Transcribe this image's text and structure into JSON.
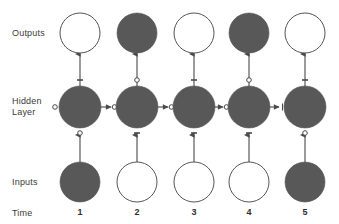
{
  "figure": {
    "type": "diagram",
    "subtype": "unfolded-recurrent-neural-network",
    "width": 339,
    "height": 224,
    "background_color": "#ffffff"
  },
  "colors": {
    "node_filled": "#585858",
    "node_empty_fill": "#ffffff",
    "node_stroke": "#555555",
    "edge": "#4a4a4a",
    "text": "#3a3a3a"
  },
  "row_labels": {
    "outputs": "Outputs",
    "hidden_line1": "Hidden",
    "hidden_line2": "Layer",
    "inputs": "Inputs",
    "time": "Time"
  },
  "geometry": {
    "column_centers": [
      80,
      137,
      194,
      249,
      305
    ],
    "row_y": {
      "outputs": 33,
      "hidden": 107,
      "inputs": 182,
      "time_labels": 213
    },
    "node_radius": {
      "outputs": 20,
      "hidden": 21,
      "inputs": 20
    }
  },
  "time_steps": [
    {
      "label": "1",
      "x": 80,
      "input_filled": true,
      "hidden_filled": true,
      "output_filled": false
    },
    {
      "label": "2",
      "x": 137,
      "input_filled": false,
      "hidden_filled": true,
      "output_filled": true
    },
    {
      "label": "3",
      "x": 194,
      "input_filled": false,
      "hidden_filled": true,
      "output_filled": false
    },
    {
      "label": "4",
      "x": 249,
      "input_filled": false,
      "hidden_filled": true,
      "output_filled": true
    },
    {
      "label": "5",
      "x": 305,
      "input_filled": true,
      "hidden_filled": true,
      "output_filled": false
    }
  ],
  "edges": {
    "input_to_hidden": {
      "direction": "up",
      "marker": "arrowhead",
      "count": 5
    },
    "hidden_to_output": {
      "direction": "up",
      "marker": "arrowhead",
      "count": 5
    },
    "hidden_to_hidden": {
      "direction": "right",
      "marker": "arrowhead-with-o",
      "count": 4
    }
  },
  "weight_markers": [
    {
      "name": "o-left-of-hidden-1",
      "glyph": "o",
      "x": 55,
      "y": 107
    },
    {
      "name": "o-above-hidden-1",
      "glyph": "-",
      "x": 80,
      "y": 80
    },
    {
      "name": "o-below-hidden-1",
      "glyph": "o",
      "x": 80,
      "y": 133
    },
    {
      "name": "o-above-hidden-2",
      "glyph": "o",
      "x": 137,
      "y": 80
    },
    {
      "name": "o-below-hidden-2",
      "glyph": "-",
      "x": 137,
      "y": 133
    },
    {
      "name": "o-above-hidden-3",
      "glyph": "-",
      "x": 194,
      "y": 80
    },
    {
      "name": "o-below-hidden-3",
      "glyph": "-",
      "x": 194,
      "y": 133
    },
    {
      "name": "o-above-hidden-4",
      "glyph": "o",
      "x": 249,
      "y": 80
    },
    {
      "name": "o-below-hidden-4",
      "glyph": "-",
      "x": 249,
      "y": 133
    },
    {
      "name": "o-above-hidden-5",
      "glyph": "-",
      "x": 305,
      "y": 80
    },
    {
      "name": "o-below-hidden-5",
      "glyph": "o",
      "x": 305,
      "y": 133
    }
  ]
}
